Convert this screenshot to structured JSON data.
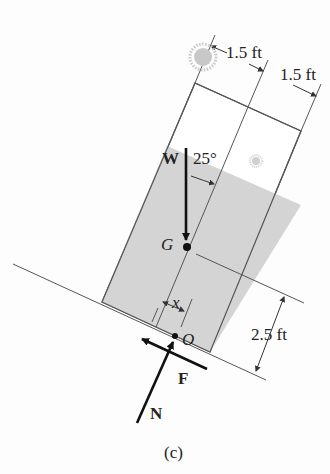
{
  "figure": {
    "caption": "(c)",
    "labels": {
      "width_top_left": "1.5 ft",
      "width_top_right": "1.5 ft",
      "height_right": "2.5 ft",
      "weight": "W",
      "angle": "25°",
      "center_of_gravity": "G",
      "offset": "x",
      "point": "O",
      "friction": "F",
      "normal": "N"
    },
    "colors": {
      "fill": "#d4d4d4",
      "line": "#555555",
      "arrow": "#111111",
      "sun": "#c8c8c8"
    }
  }
}
